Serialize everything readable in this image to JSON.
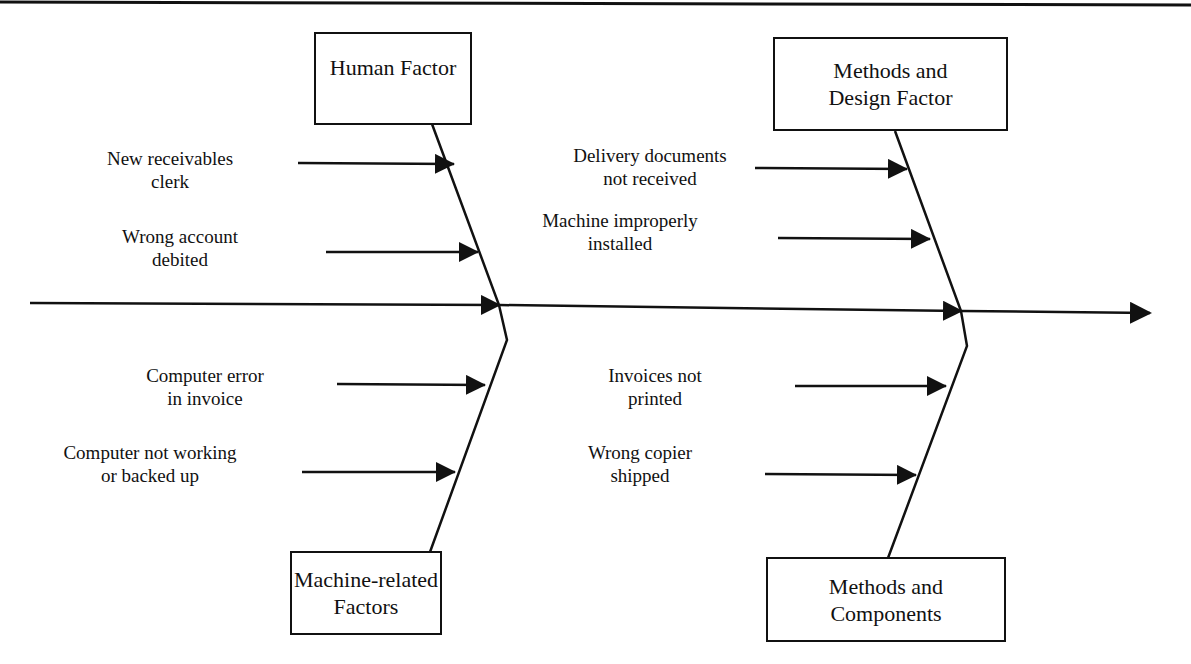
{
  "diagram": {
    "type": "fishbone",
    "colors": {
      "line": "#111111",
      "background": "#ffffff"
    },
    "categories": [
      {
        "id": "human",
        "label_line1": "Human Factor",
        "label_line2": "",
        "causes": [
          {
            "line1": "New receivables",
            "line2": "clerk"
          },
          {
            "line1": "Wrong account",
            "line2": "debited"
          }
        ]
      },
      {
        "id": "methods_design",
        "label_line1": "Methods and",
        "label_line2": "Design Factor",
        "causes": [
          {
            "line1": "Delivery documents",
            "line2": "not received"
          },
          {
            "line1": "Machine improperly",
            "line2": "installed"
          }
        ]
      },
      {
        "id": "machine",
        "label_line1": "Machine-related",
        "label_line2": "Factors",
        "causes": [
          {
            "line1": "Computer error",
            "line2": "in invoice"
          },
          {
            "line1": "Computer not working",
            "line2": "or backed up"
          }
        ]
      },
      {
        "id": "methods_components",
        "label_line1": "Methods and",
        "label_line2": "Components",
        "causes": [
          {
            "line1": "Invoices not",
            "line2": "printed"
          },
          {
            "line1": "Wrong copier",
            "line2": "shipped"
          }
        ]
      }
    ]
  }
}
